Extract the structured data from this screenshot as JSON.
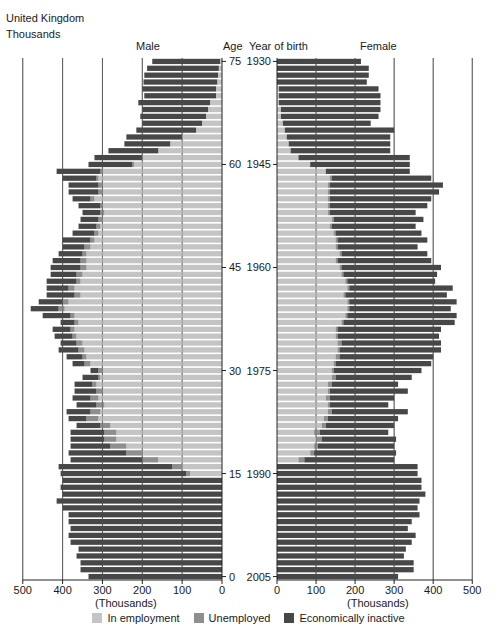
{
  "header": {
    "title": "United Kingdom",
    "subtitle": "Thousands"
  },
  "labels": {
    "male": "Male",
    "female": "Female",
    "age": "Age",
    "year_of_birth": "Year of birth",
    "x_unit_left": "(Thousands)",
    "x_unit_right": "(Thousands)"
  },
  "legend": [
    {
      "label": "In employment",
      "color": "#c4c4c4"
    },
    {
      "label": "Unemployed",
      "color": "#8e8e8e"
    },
    {
      "label": "Economically inactive",
      "color": "#474747"
    }
  ],
  "chart_data": {
    "type": "bar",
    "subtype": "population-pyramid-stacked",
    "title": "United Kingdom",
    "subtitle": "Thousands",
    "xlabel": "(Thousands)",
    "ylabel": "Age / Year of birth",
    "xlim": [
      0,
      500
    ],
    "x_ticks": [
      0,
      100,
      200,
      300,
      400,
      500
    ],
    "age_ticks": [
      75,
      60,
      45,
      30,
      15,
      0
    ],
    "year_ticks": [
      1930,
      1945,
      1960,
      1975,
      1990,
      2005
    ],
    "grid": true,
    "legend_position": "bottom",
    "series_names": [
      "In employment",
      "Unemployed",
      "Economically inactive"
    ],
    "ages": [
      75,
      74,
      73,
      72,
      71,
      70,
      69,
      68,
      67,
      66,
      65,
      64,
      63,
      62,
      61,
      60,
      59,
      58,
      57,
      56,
      55,
      54,
      53,
      52,
      51,
      50,
      49,
      48,
      47,
      46,
      45,
      44,
      43,
      42,
      41,
      40,
      39,
      38,
      37,
      36,
      35,
      34,
      33,
      32,
      31,
      30,
      29,
      28,
      27,
      26,
      25,
      24,
      23,
      22,
      21,
      20,
      19,
      18,
      17,
      16,
      15,
      14,
      13,
      12,
      11,
      10,
      9,
      8,
      7,
      6,
      5,
      4,
      3,
      2,
      1,
      0
    ],
    "male": {
      "employment": [
        5,
        8,
        10,
        12,
        15,
        15,
        30,
        35,
        40,
        50,
        65,
        100,
        130,
        160,
        200,
        220,
        300,
        310,
        300,
        300,
        320,
        300,
        295,
        300,
        305,
        310,
        320,
        330,
        340,
        340,
        340,
        350,
        355,
        370,
        355,
        385,
        395,
        370,
        360,
        370,
        365,
        350,
        345,
        340,
        330,
        300,
        305,
        315,
        300,
        310,
        295,
        305,
        310,
        280,
        265,
        265,
        240,
        200,
        160,
        100,
        80,
        0,
        0,
        0,
        0,
        0,
        0,
        0,
        0,
        0,
        0,
        0,
        0,
        0,
        0,
        0
      ],
      "unemployed": [
        0,
        0,
        0,
        0,
        0,
        0,
        0,
        0,
        0,
        0,
        0,
        0,
        0,
        0,
        0,
        5,
        5,
        5,
        10,
        10,
        10,
        5,
        10,
        10,
        10,
        10,
        10,
        15,
        10,
        15,
        15,
        15,
        10,
        15,
        15,
        15,
        15,
        10,
        10,
        10,
        10,
        15,
        15,
        10,
        15,
        10,
        5,
        10,
        15,
        20,
        20,
        25,
        30,
        25,
        30,
        30,
        40,
        40,
        40,
        25,
        10,
        0,
        0,
        0,
        0,
        0,
        0,
        0,
        0,
        0,
        0,
        0,
        0,
        0,
        0,
        0
      ],
      "inactive": [
        170,
        180,
        185,
        185,
        185,
        180,
        180,
        165,
        165,
        150,
        150,
        140,
        115,
        125,
        120,
        110,
        110,
        85,
        75,
        75,
        45,
        55,
        45,
        45,
        45,
        55,
        70,
        55,
        60,
        70,
        75,
        65,
        75,
        55,
        70,
        60,
        70,
        70,
        35,
        45,
        45,
        40,
        50,
        40,
        30,
        20,
        40,
        45,
        55,
        45,
        50,
        60,
        45,
        60,
        85,
        85,
        100,
        145,
        180,
        285,
        315,
        400,
        405,
        400,
        415,
        400,
        385,
        385,
        380,
        385,
        380,
        360,
        365,
        355,
        355,
        335
      ]
    },
    "female": {
      "employment": [
        0,
        0,
        0,
        0,
        5,
        5,
        5,
        10,
        10,
        15,
        20,
        25,
        30,
        35,
        55,
        85,
        125,
        135,
        130,
        130,
        130,
        130,
        130,
        140,
        135,
        145,
        150,
        150,
        160,
        150,
        160,
        165,
        175,
        180,
        170,
        180,
        180,
        175,
        165,
        150,
        150,
        155,
        155,
        150,
        145,
        140,
        140,
        130,
        130,
        125,
        130,
        130,
        120,
        115,
        95,
        100,
        95,
        85,
        55,
        0,
        0,
        0,
        0,
        0,
        0,
        0,
        0,
        0,
        0,
        0,
        0,
        0,
        0,
        0,
        0,
        0
      ],
      "unemployed": [
        0,
        0,
        0,
        0,
        0,
        0,
        0,
        0,
        0,
        0,
        0,
        0,
        0,
        0,
        0,
        0,
        0,
        5,
        5,
        5,
        5,
        5,
        5,
        5,
        5,
        5,
        5,
        5,
        5,
        5,
        5,
        5,
        5,
        5,
        5,
        5,
        5,
        5,
        5,
        5,
        5,
        10,
        5,
        10,
        5,
        5,
        10,
        10,
        5,
        10,
        5,
        10,
        10,
        10,
        15,
        15,
        10,
        10,
        15,
        0,
        0,
        0,
        0,
        0,
        0,
        0,
        0,
        0,
        0,
        0,
        0,
        0,
        0,
        0,
        0,
        0
      ],
      "inactive": [
        215,
        235,
        235,
        230,
        255,
        260,
        260,
        255,
        250,
        225,
        280,
        265,
        260,
        255,
        285,
        255,
        215,
        255,
        290,
        280,
        260,
        250,
        220,
        230,
        215,
        220,
        230,
        205,
        220,
        240,
        255,
        240,
        225,
        265,
        260,
        275,
        260,
        280,
        285,
        265,
        260,
        255,
        260,
        240,
        245,
        225,
        195,
        170,
        200,
        165,
        150,
        195,
        180,
        175,
        175,
        190,
        195,
        210,
        230,
        360,
        360,
        370,
        370,
        380,
        365,
        360,
        365,
        345,
        335,
        355,
        345,
        330,
        325,
        350,
        350,
        310
      ]
    },
    "note": "Values estimated from bar pixel positions; approximate."
  }
}
